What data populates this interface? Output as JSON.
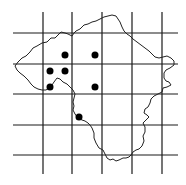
{
  "map": {
    "colors": {
      "background": "#ffffff",
      "grid": "#1a1a1a",
      "outline": "#222222",
      "marker": "#000000"
    },
    "grid": {
      "vertical_x": [
        43,
        72,
        102,
        132,
        162
      ],
      "vertical_y_range": [
        12,
        174
      ],
      "horizontal_y": [
        33,
        64,
        94,
        125,
        155
      ],
      "horizontal_x_range": [
        13,
        178
      ]
    },
    "markers": [
      {
        "x": 65,
        "y": 55
      },
      {
        "x": 95,
        "y": 55
      },
      {
        "x": 50,
        "y": 71
      },
      {
        "x": 65,
        "y": 71
      },
      {
        "x": 50,
        "y": 87
      },
      {
        "x": 95,
        "y": 87
      },
      {
        "x": 79,
        "y": 117
      }
    ],
    "marker_radius": 3.5
  }
}
